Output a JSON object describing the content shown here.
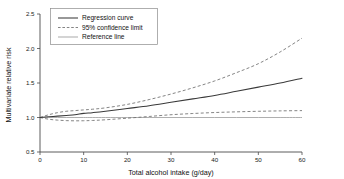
{
  "chart_data": {
    "type": "line",
    "title": "",
    "xlabel": "Total alcohol intake (g/day)",
    "ylabel": "Multivariate relative risk",
    "xlim": [
      0,
      60
    ],
    "ylim": [
      0.5,
      2.5
    ],
    "xticks": [
      "0",
      "10",
      "20",
      "30",
      "40",
      "50",
      "60"
    ],
    "yticks": [
      "0.5",
      "1.0",
      "1.5",
      "2.0",
      "2.5"
    ],
    "grid": false,
    "legend_position": "top-left",
    "legend": [
      {
        "label": "Regression curve",
        "style": "solid",
        "color": "#3a3a3a"
      },
      {
        "label": "95% confidence limit",
        "style": "dashed",
        "color": "#6e6e6e"
      },
      {
        "label": "Reference line",
        "style": "solid",
        "color": "#9a9a9a"
      }
    ],
    "x": [
      0,
      2,
      4,
      6,
      8,
      10,
      12,
      15,
      20,
      25,
      30,
      35,
      40,
      45,
      50,
      55,
      60
    ],
    "series": [
      {
        "name": "Regression curve",
        "style": "solid",
        "values": [
          1.0,
          1.01,
          1.02,
          1.03,
          1.04,
          1.06,
          1.07,
          1.09,
          1.13,
          1.17,
          1.22,
          1.27,
          1.32,
          1.38,
          1.44,
          1.5,
          1.57
        ]
      },
      {
        "name": "95% confidence limit (upper)",
        "style": "dashed",
        "values": [
          1.0,
          1.04,
          1.07,
          1.09,
          1.1,
          1.11,
          1.12,
          1.14,
          1.19,
          1.26,
          1.34,
          1.43,
          1.53,
          1.65,
          1.78,
          1.95,
          2.15
        ]
      },
      {
        "name": "95% confidence limit (lower)",
        "style": "dashed",
        "values": [
          1.0,
          0.975,
          0.962,
          0.955,
          0.952,
          0.953,
          0.957,
          0.967,
          0.99,
          1.015,
          1.04,
          1.058,
          1.072,
          1.082,
          1.09,
          1.096,
          1.1
        ]
      },
      {
        "name": "Reference line",
        "style": "solid",
        "values": [
          1.0,
          1.0,
          1.0,
          1.0,
          1.0,
          1.0,
          1.0,
          1.0,
          1.0,
          1.0,
          1.0,
          1.0,
          1.0,
          1.0,
          1.0,
          1.0,
          1.0
        ]
      }
    ]
  }
}
